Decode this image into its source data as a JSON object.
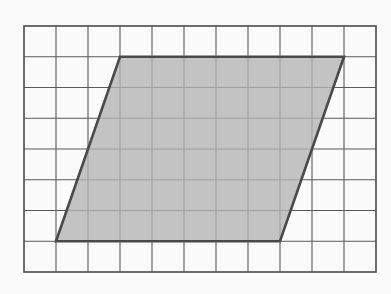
{
  "figure": {
    "name": "parallelogram-on-grid",
    "background_color": "#fbfbfb"
  },
  "grid": {
    "columns": 11,
    "rows": 8,
    "origin_x": 24,
    "origin_y": 26,
    "cell_width": 32,
    "cell_height": 30.75,
    "line_color": "#5a5a5a",
    "line_width": 1.1,
    "border_color": "#4a4a4a",
    "border_width": 1.6
  },
  "shape": {
    "type": "parallelogram",
    "fill_color": "#b3b3b3",
    "fill_opacity": 0.78,
    "stroke_color": "#4a4a4a",
    "stroke_width": 2.6,
    "vertices_grid": [
      {
        "label": "bottom-left",
        "col": 1,
        "row": 7
      },
      {
        "label": "top-left",
        "col": 3,
        "row": 1
      },
      {
        "label": "top-right",
        "col": 10,
        "row": 1
      },
      {
        "label": "bottom-right",
        "col": 8,
        "row": 7
      }
    ],
    "base_units": 7,
    "height_units": 6,
    "slant_offset_units": 2,
    "area_square_units": 42
  },
  "chart_data": {
    "type": "scatter",
    "title": "",
    "xlabel": "",
    "ylabel": "",
    "xlim": [
      0,
      11
    ],
    "ylim": [
      0,
      8
    ],
    "grid": true,
    "legend": "none",
    "series": [
      {
        "name": "parallelogram",
        "x": [
          1,
          3,
          10,
          8,
          1
        ],
        "y": [
          1,
          7,
          7,
          1,
          1
        ]
      }
    ],
    "annotations": []
  }
}
